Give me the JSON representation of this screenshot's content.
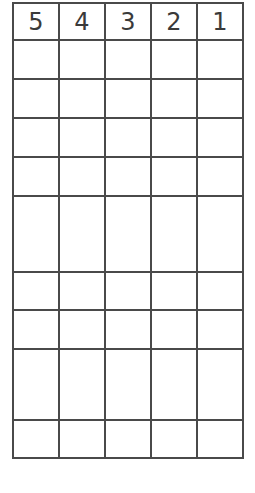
{
  "worksheet": {
    "header": [
      "5",
      "4",
      "3",
      "2",
      "1"
    ],
    "row_heights": [
      37,
      37,
      37,
      37,
      74,
      36,
      37,
      69,
      36
    ],
    "rows": [
      [
        "",
        "",
        "",
        "",
        ""
      ],
      [
        "",
        "",
        "",
        "",
        ""
      ],
      [
        "",
        "",
        "",
        "",
        ""
      ],
      [
        "",
        "",
        "",
        "",
        ""
      ],
      [
        "",
        "",
        "",
        "",
        ""
      ],
      [
        "",
        "",
        "",
        "",
        ""
      ],
      [
        "",
        "",
        "",
        "",
        ""
      ],
      [
        "",
        "",
        "",
        "",
        ""
      ],
      [
        "",
        "",
        "",
        "",
        ""
      ]
    ]
  }
}
